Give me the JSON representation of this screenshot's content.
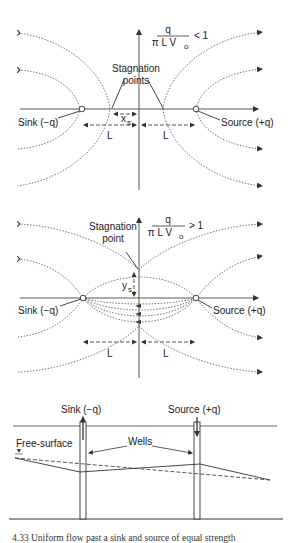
{
  "panel1": {
    "ratio_numerator": "q",
    "ratio_denominator": "π L V",
    "ratio_sub": "o",
    "ratio_relation": "< 1",
    "stagnation_label_line1": "Stagnation",
    "stagnation_label_line2": "points",
    "sink_label": "Sink (−q)",
    "source_label": "Source (+q)",
    "xs_label": "x",
    "xs_sub": "s",
    "L_left": "L",
    "L_right": "L"
  },
  "panel2": {
    "ratio_numerator": "q",
    "ratio_denominator": "π L V",
    "ratio_sub": "o",
    "ratio_relation": "> 1",
    "stagnation_label_line1": "Stagnation",
    "stagnation_label_line2": "point",
    "sink_label": "Sink (−q)",
    "source_label": "Source (+q)",
    "ys_label": "y",
    "ys_sub": "s",
    "L_left": "L",
    "L_right": "L"
  },
  "panel3": {
    "sink_label": "Sink (−q)",
    "source_label": "Source (+q)",
    "free_surface_label": "Free-surface",
    "wells_label": "Wells"
  },
  "caption": {
    "text": "4.33  Uniform flow past a sink and source of equal strength"
  }
}
